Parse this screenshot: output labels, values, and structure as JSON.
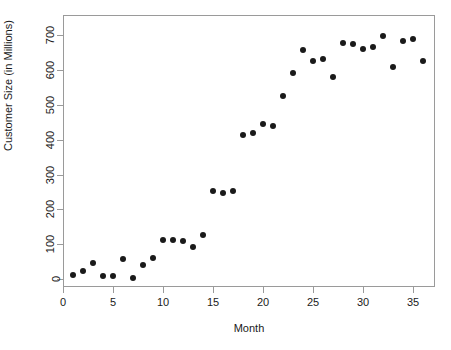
{
  "chart_data": {
    "type": "scatter",
    "title": "",
    "xlabel": "Month",
    "ylabel": "Customer Size (in Millions)",
    "xlim": [
      0.0,
      37.2
    ],
    "ylim": [
      -22,
      757
    ],
    "grid": false,
    "legend": null,
    "xticks": [
      0,
      5,
      10,
      15,
      20,
      25,
      30,
      35
    ],
    "yticks": [
      0,
      100,
      200,
      300,
      400,
      500,
      600,
      700
    ],
    "marker": {
      "shape": "circle",
      "filled": true,
      "color": "#1a1a1a",
      "size_px": 6
    },
    "x": [
      1,
      2,
      3,
      4,
      5,
      6,
      7,
      8,
      9,
      10,
      11,
      12,
      13,
      14,
      15,
      16,
      17,
      18,
      19,
      20,
      21,
      22,
      23,
      24,
      25,
      26,
      27,
      28,
      29,
      30,
      31,
      32,
      33,
      34,
      35,
      36
    ],
    "y": [
      12,
      23,
      46,
      9,
      9,
      57,
      3,
      40,
      60,
      112,
      112,
      109,
      92,
      126,
      252,
      246,
      252,
      413,
      418,
      444,
      438,
      524,
      590,
      656,
      625,
      630,
      579,
      676,
      673,
      659,
      665,
      696,
      607,
      682,
      688,
      625
    ],
    "points": [
      {
        "x": 1,
        "y": 12
      },
      {
        "x": 2,
        "y": 23
      },
      {
        "x": 3,
        "y": 46
      },
      {
        "x": 4,
        "y": 9
      },
      {
        "x": 5,
        "y": 9
      },
      {
        "x": 6,
        "y": 57
      },
      {
        "x": 7,
        "y": 3
      },
      {
        "x": 8,
        "y": 40
      },
      {
        "x": 9,
        "y": 60
      },
      {
        "x": 10,
        "y": 112
      },
      {
        "x": 11,
        "y": 112
      },
      {
        "x": 12,
        "y": 109
      },
      {
        "x": 13,
        "y": 92
      },
      {
        "x": 14,
        "y": 126
      },
      {
        "x": 15,
        "y": 252
      },
      {
        "x": 16,
        "y": 246
      },
      {
        "x": 17,
        "y": 252
      },
      {
        "x": 18,
        "y": 413
      },
      {
        "x": 19,
        "y": 418
      },
      {
        "x": 20,
        "y": 444
      },
      {
        "x": 21,
        "y": 438
      },
      {
        "x": 22,
        "y": 524
      },
      {
        "x": 23,
        "y": 590
      },
      {
        "x": 24,
        "y": 656
      },
      {
        "x": 25,
        "y": 625
      },
      {
        "x": 26,
        "y": 630
      },
      {
        "x": 27,
        "y": 579
      },
      {
        "x": 28,
        "y": 676
      },
      {
        "x": 29,
        "y": 673
      },
      {
        "x": 30,
        "y": 659
      },
      {
        "x": 31,
        "y": 665
      },
      {
        "x": 32,
        "y": 696
      },
      {
        "x": 33,
        "y": 607
      },
      {
        "x": 34,
        "y": 682
      },
      {
        "x": 35,
        "y": 688
      },
      {
        "x": 36,
        "y": 625
      }
    ]
  },
  "axes": {
    "x_tick_labels": [
      "0",
      "5",
      "10",
      "15",
      "20",
      "25",
      "30",
      "35"
    ],
    "y_tick_labels": [
      "0",
      "100",
      "200",
      "300",
      "400",
      "500",
      "600",
      "700"
    ],
    "x_title": "Month",
    "y_title": "Customer Size (in Millions)"
  },
  "style": {
    "frame_color": "#9a9a9a",
    "point_color": "#1a1a1a",
    "background": "#ffffff",
    "text_color": "#1a1a1a"
  }
}
